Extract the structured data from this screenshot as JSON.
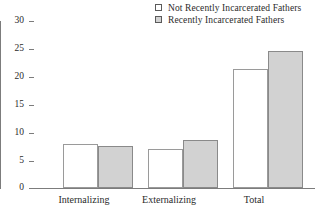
{
  "chart_data": {
    "type": "bar",
    "title": "",
    "subtitle": "",
    "xlabel": "",
    "ylabel": "",
    "categories": [
      "Internalizing",
      "Externalizing",
      "Total"
    ],
    "series": [
      {
        "name": "Not Recently Incarcerated Fathers",
        "values": [
          7.9,
          7.0,
          21.4
        ],
        "color": "#ffffff"
      },
      {
        "name": "Recently Incarcerated Fathers",
        "values": [
          7.6,
          8.6,
          24.6
        ],
        "color": "#d2d2d2"
      }
    ],
    "ylim": [
      0,
      30
    ],
    "ytick_values": [
      0,
      5,
      10,
      15,
      20,
      25,
      30
    ],
    "ytick_labels": [
      "0",
      "5",
      "10",
      "15",
      "20",
      "25",
      "30"
    ],
    "grid": false,
    "legend_position": "top-right"
  },
  "legend": {
    "items": [
      {
        "label": "Not Recently Incarcerated Fathers",
        "swatch": "empty-square-icon"
      },
      {
        "label": "Recently Incarcerated Fathers",
        "swatch": "filled-square-icon"
      }
    ]
  },
  "axes": {
    "y_labels": [
      "30",
      "25",
      "20",
      "15",
      "10",
      "5",
      "0"
    ],
    "x_labels": [
      "Internalizing",
      "Externalizing",
      "Total"
    ]
  },
  "colors": {
    "series_white": "#ffffff",
    "series_gray": "#d2d2d2",
    "axis": "#7c7c7c",
    "bar_border": "#8e8e8e",
    "text": "#2b2b2b",
    "background": "#ffffff"
  }
}
